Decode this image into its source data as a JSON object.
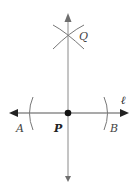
{
  "diagram": {
    "type": "geometric-construction",
    "colors": {
      "line": "#8a8a8a",
      "horizontal_line": "#555555",
      "arc": "#777777",
      "point": "#111111",
      "arrowhead": "#222222"
    },
    "labels": {
      "Q": "Q",
      "A": "A",
      "P": "P",
      "B": "B",
      "line_l": "ℓ"
    },
    "points": {
      "P": {
        "x": 68,
        "y": 113
      },
      "Q": {
        "x": 68,
        "y": 35
      }
    }
  }
}
